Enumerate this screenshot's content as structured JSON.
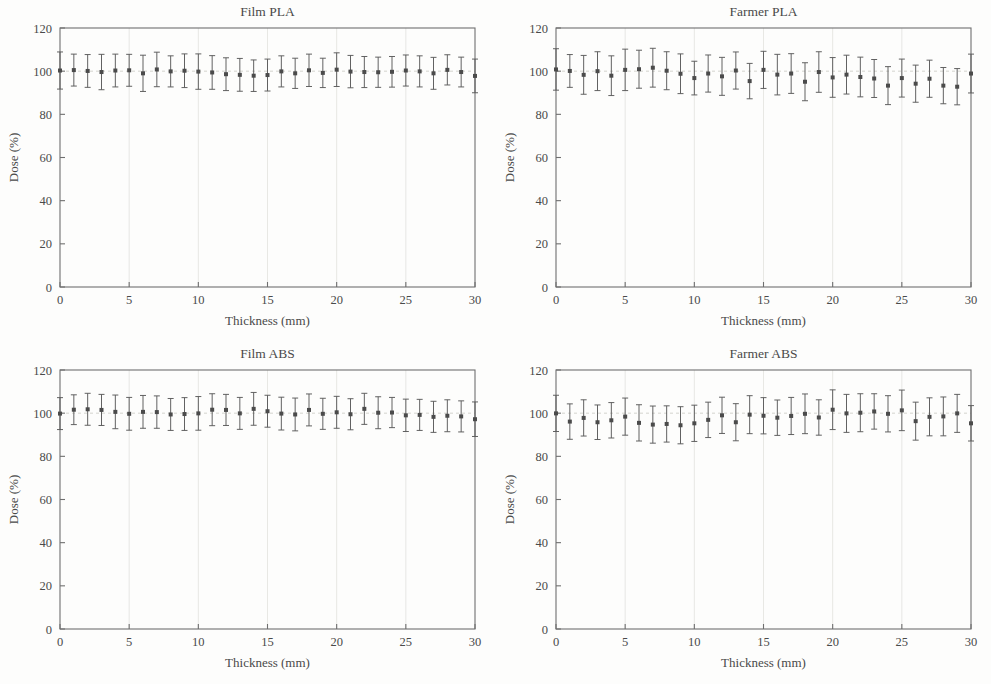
{
  "figure": {
    "background_color": "#fdfdfc",
    "ink_color": "#4a4a4a",
    "marker_color": "#4b4b4b",
    "grid_color": "#e2e2dd"
  },
  "chart_data": [
    {
      "type": "scatter",
      "panel_index": 0,
      "title": "Film PLA",
      "xlabel": "Thickness (mm)",
      "ylabel": "Dose (%)",
      "xlim": [
        0,
        30
      ],
      "ylim": [
        0,
        120
      ],
      "xticks": [
        0,
        5,
        10,
        15,
        20,
        25,
        30
      ],
      "yticks": [
        0,
        20,
        40,
        60,
        80,
        100,
        120
      ],
      "xticklabels": [
        "0",
        "5",
        "10",
        "15",
        "20",
        "25",
        "30"
      ],
      "yticklabels": [
        "0",
        "20",
        "40",
        "60",
        "80",
        "100",
        "120"
      ],
      "grid": true,
      "legend": "none",
      "reference_line_y": 100,
      "error_kind": "symmetric-stddev",
      "x": [
        0,
        1,
        2,
        3,
        4,
        5,
        6,
        7,
        8,
        9,
        10,
        11,
        12,
        13,
        14,
        15,
        16,
        17,
        18,
        19,
        20,
        21,
        22,
        23,
        24,
        25,
        26,
        27,
        28,
        29,
        30
      ],
      "y": [
        100.3,
        100.5,
        100.1,
        99.6,
        100.3,
        100.4,
        99.0,
        100.8,
        99.9,
        100.2,
        99.8,
        99.4,
        98.6,
        98.3,
        97.9,
        98.2,
        99.9,
        99.0,
        100.4,
        99.2,
        100.7,
        99.8,
        99.6,
        99.5,
        99.7,
        100.3,
        99.9,
        99.0,
        100.6,
        99.6,
        97.8
      ],
      "yerr": [
        8.6,
        7.4,
        7.6,
        8.2,
        7.6,
        7.4,
        8.4,
        8.0,
        7.2,
        7.8,
        8.2,
        7.8,
        7.6,
        7.6,
        7.3,
        7.4,
        7.2,
        7.0,
        7.5,
        6.8,
        7.8,
        7.5,
        7.2,
        7.0,
        7.1,
        7.2,
        7.2,
        7.4,
        7.0,
        6.9,
        7.8
      ]
    },
    {
      "type": "scatter",
      "panel_index": 1,
      "title": "Farmer PLA",
      "xlabel": "Thickness (mm)",
      "ylabel": "Dose (%)",
      "xlim": [
        0,
        30
      ],
      "ylim": [
        0,
        120
      ],
      "xticks": [
        0,
        5,
        10,
        15,
        20,
        25,
        30
      ],
      "yticks": [
        0,
        20,
        40,
        60,
        80,
        100,
        120
      ],
      "xticklabels": [
        "0",
        "5",
        "10",
        "15",
        "20",
        "25",
        "30"
      ],
      "yticklabels": [
        "0",
        "20",
        "40",
        "60",
        "80",
        "100",
        "120"
      ],
      "grid": true,
      "legend": "none",
      "reference_line_y": 100,
      "error_kind": "symmetric-stddev",
      "x": [
        0,
        1,
        2,
        3,
        4,
        5,
        6,
        7,
        8,
        9,
        10,
        11,
        12,
        13,
        14,
        15,
        16,
        17,
        18,
        19,
        20,
        21,
        22,
        23,
        24,
        25,
        26,
        27,
        28,
        29,
        30
      ],
      "y": [
        100.8,
        100.1,
        98.3,
        100.0,
        97.9,
        100.6,
        100.9,
        101.6,
        100.2,
        98.8,
        96.8,
        98.9,
        97.6,
        100.3,
        95.4,
        100.6,
        98.4,
        98.9,
        95.1,
        99.6,
        97.1,
        98.4,
        97.3,
        96.6,
        93.3,
        96.8,
        94.2,
        96.5,
        93.3,
        92.8,
        98.9
      ],
      "yerr": [
        9.6,
        7.6,
        9.0,
        9.0,
        9.2,
        9.6,
        8.8,
        9.0,
        8.8,
        9.2,
        7.8,
        8.6,
        8.8,
        8.6,
        8.2,
        8.6,
        9.4,
        9.2,
        8.8,
        9.4,
        9.2,
        9.0,
        9.2,
        8.8,
        8.8,
        8.8,
        8.6,
        8.6,
        8.4,
        8.4,
        9.0
      ]
    },
    {
      "type": "scatter",
      "panel_index": 2,
      "title": "Film ABS",
      "xlabel": "Thickness (mm)",
      "ylabel": "Dose (%)",
      "xlim": [
        0,
        30
      ],
      "ylim": [
        0,
        120
      ],
      "xticks": [
        0,
        5,
        10,
        15,
        20,
        25,
        30
      ],
      "yticks": [
        0,
        20,
        40,
        60,
        80,
        100,
        120
      ],
      "xticklabels": [
        "0",
        "5",
        "10",
        "15",
        "20",
        "25",
        "30"
      ],
      "yticklabels": [
        "0",
        "20",
        "40",
        "60",
        "80",
        "100",
        "120"
      ],
      "grid": true,
      "legend": "none",
      "reference_line_y": 100,
      "error_kind": "symmetric-stddev",
      "x": [
        0,
        1,
        2,
        3,
        4,
        5,
        6,
        7,
        8,
        9,
        10,
        11,
        12,
        13,
        14,
        15,
        16,
        17,
        18,
        19,
        20,
        21,
        22,
        23,
        24,
        25,
        26,
        27,
        28,
        29,
        30
      ],
      "y": [
        99.8,
        101.6,
        101.8,
        101.5,
        100.6,
        99.7,
        100.6,
        100.5,
        99.4,
        99.6,
        99.9,
        101.6,
        101.5,
        99.9,
        102.0,
        100.9,
        99.8,
        99.4,
        101.5,
        99.7,
        100.4,
        99.5,
        102.0,
        100.2,
        100.3,
        99.0,
        99.2,
        98.3,
        98.8,
        98.5,
        97.2
      ],
      "yerr": [
        7.4,
        6.9,
        7.4,
        7.2,
        7.8,
        7.6,
        7.6,
        7.5,
        7.4,
        7.6,
        7.8,
        7.4,
        7.2,
        7.4,
        7.6,
        7.4,
        7.6,
        7.6,
        7.4,
        7.2,
        7.4,
        7.2,
        7.2,
        7.4,
        7.0,
        7.5,
        7.2,
        7.2,
        7.4,
        7.2,
        8.0
      ]
    },
    {
      "type": "scatter",
      "panel_index": 3,
      "title": "Farmer ABS",
      "xlabel": "Thickness (mm)",
      "ylabel": "Dose (%)",
      "xlim": [
        0,
        30
      ],
      "ylim": [
        0,
        120
      ],
      "xticks": [
        0,
        5,
        10,
        15,
        20,
        25,
        30
      ],
      "yticks": [
        0,
        20,
        40,
        60,
        80,
        100,
        120
      ],
      "xticklabels": [
        "0",
        "5",
        "10",
        "15",
        "20",
        "25",
        "30"
      ],
      "yticklabels": [
        "0",
        "20",
        "40",
        "60",
        "80",
        "100",
        "120"
      ],
      "grid": true,
      "legend": "none",
      "reference_line_y": 100,
      "error_kind": "symmetric-stddev",
      "x": [
        0,
        1,
        2,
        3,
        4,
        5,
        6,
        7,
        8,
        9,
        10,
        11,
        12,
        13,
        14,
        15,
        16,
        17,
        18,
        19,
        20,
        21,
        22,
        23,
        24,
        25,
        26,
        27,
        28,
        29,
        30
      ],
      "y": [
        99.9,
        96.1,
        97.8,
        95.8,
        96.7,
        98.4,
        95.5,
        94.7,
        95.0,
        94.4,
        95.3,
        96.9,
        99.0,
        95.8,
        99.3,
        98.8,
        97.9,
        98.7,
        99.7,
        98.0,
        101.6,
        99.9,
        100.2,
        100.8,
        99.7,
        101.3,
        96.3,
        98.3,
        98.5,
        99.9,
        95.3
      ],
      "yerr": [
        8.4,
        8.2,
        8.4,
        8.0,
        8.2,
        8.6,
        8.4,
        8.6,
        8.4,
        8.6,
        8.4,
        8.2,
        8.4,
        8.6,
        8.8,
        8.4,
        8.2,
        8.6,
        9.2,
        8.2,
        9.2,
        8.8,
        8.8,
        8.2,
        8.4,
        9.4,
        8.8,
        8.8,
        9.0,
        8.8,
        8.2
      ]
    }
  ]
}
